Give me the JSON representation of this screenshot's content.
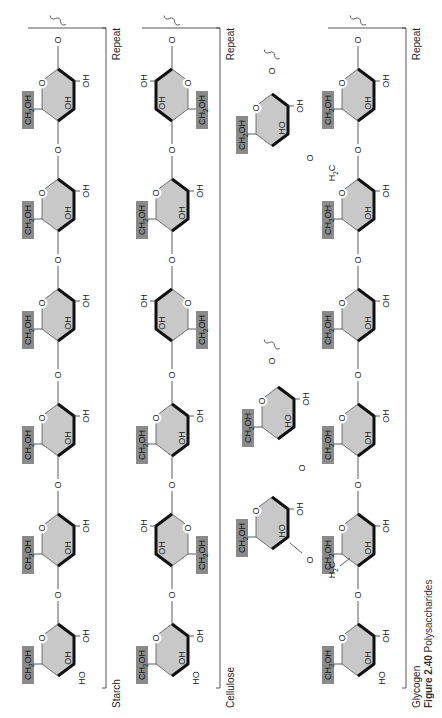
{
  "figure": {
    "caption_number": "Figure 2.40",
    "caption_title": "Polysaccharides",
    "orientation": "rotated 90° counter-clockwise",
    "colors": {
      "ring_fill": "#c8c8c8",
      "group_box": "#8a8a8a",
      "line": "#222222"
    }
  },
  "rows": [
    {
      "label": "Starch",
      "repeat_label": "Repeat",
      "units": 6,
      "linkage": "alpha-1,4",
      "groups": {
        "top": "CH2OH",
        "inner": "OH",
        "bottom": "OH",
        "end": "HO"
      }
    },
    {
      "label": "Cellulose",
      "repeat_label": "Repeat",
      "units": 6,
      "linkage": "beta-1,4 (alternating flip)",
      "groups": {
        "top": "CH2OH",
        "inner": "OH",
        "bottom": "OH",
        "end": "HO"
      }
    },
    {
      "label": "Glycogen",
      "repeat_label": "Repeat",
      "units": 6,
      "linkage": "alpha-1,4 with alpha-1,6 branches",
      "groups": {
        "top": "CH2OH",
        "inner": "OH",
        "bottom": "OH",
        "end": "HO",
        "branch_point": "H2C"
      }
    }
  ],
  "labels": {
    "ring_oxygen": "O",
    "glycosidic_oxygen": "O",
    "ch2oh_main": "CH",
    "ch2oh_sub": "2",
    "ch2oh_tail": "OH",
    "oh": "OH",
    "ho": "HO",
    "h2c_main": "H",
    "h2c_sub": "2",
    "h2c_tail": "C"
  }
}
